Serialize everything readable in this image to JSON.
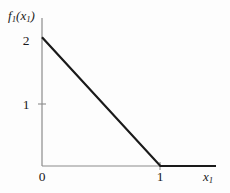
{
  "chart_data": {
    "type": "line",
    "title": "",
    "xlabel": "x₁",
    "ylabel": "f₁(x₁)",
    "xlabel_base": "x",
    "xlabel_sub": "1",
    "ylabel_base": "f",
    "ylabel_sub": "1",
    "ylabel_arg_base": "x",
    "ylabel_arg_sub": "1",
    "xlim": [
      0,
      1.47
    ],
    "ylim": [
      0,
      2.3
    ],
    "grid": false,
    "legend": null,
    "x_ticks": [
      {
        "value": 0,
        "label": "0"
      },
      {
        "value": 1,
        "label": "1"
      }
    ],
    "y_ticks": [
      {
        "value": 1,
        "label": "1"
      },
      {
        "value": 2,
        "label": "2"
      }
    ],
    "series": [
      {
        "name": "f₁(x₁)",
        "color": "#1a1a1a",
        "x": [
          0,
          1,
          1.47
        ],
        "values": [
          2,
          0,
          0
        ],
        "description": "piecewise linear: decreases from 2 at x=0 to 0 at x=1, then constant 0"
      }
    ],
    "axis_color": "#8c8c8c",
    "line_color": "#1a1a1a",
    "background_color": "#fdfdfd"
  },
  "geometry": {
    "origin_x": 42,
    "origin_y": 166,
    "y_axis_top": 18,
    "x_axis_right": 216,
    "y2_pixel": 41,
    "y1_pixel": 104,
    "x1_pixel": 160
  }
}
